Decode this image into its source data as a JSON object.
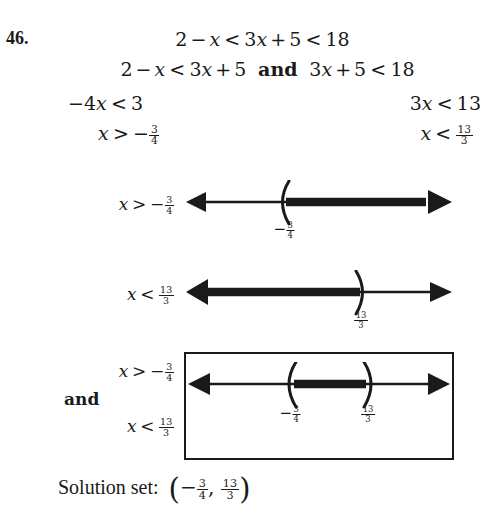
{
  "problem": {
    "number": "46.",
    "compound_inequality": "2 - x < 3x + 5 < 18"
  },
  "steps": {
    "split_left": "2 - x < 3x + 5",
    "split_connector": "and",
    "split_right": "3x + 5 < 18",
    "step2_left": "-4x < 3",
    "step2_right": "3x < 13",
    "step3_left": "x > -3/4",
    "step3_right": "x < 13/3"
  },
  "number_lines": [
    {
      "id": "line-1",
      "label": "x > -3/4",
      "label_parts": {
        "var": "x",
        "rel": ">",
        "sign": "-",
        "num": "3",
        "den": "4"
      },
      "tick_label": {
        "sign": "-",
        "num": "3",
        "den": "4"
      },
      "tick_position_pct": 38,
      "bracket": "(",
      "shaded_direction": "right",
      "left_arrow": true,
      "right_arrow": true
    },
    {
      "id": "line-2",
      "label": "x < 13/3",
      "label_parts": {
        "var": "x",
        "rel": "<",
        "sign": "",
        "num": "13",
        "den": "3"
      },
      "tick_label": {
        "sign": "",
        "num": "13",
        "den": "3"
      },
      "tick_position_pct": 66,
      "bracket": ")",
      "shaded_direction": "left",
      "left_arrow": true,
      "right_arrow": true
    }
  ],
  "intersection": {
    "label_lines": [
      {
        "type": "inequality",
        "var": "x",
        "rel": ">",
        "sign": "-",
        "num": "3",
        "den": "4"
      },
      {
        "type": "word",
        "text": "and"
      },
      {
        "type": "inequality",
        "var": "x",
        "rel": "<",
        "sign": "",
        "num": "13",
        "den": "3"
      }
    ],
    "left_bracket": "(",
    "right_bracket": ")",
    "left_tick": {
      "sign": "-",
      "num": "3",
      "den": "4"
    },
    "right_tick": {
      "sign": "",
      "num": "13",
      "den": "3"
    },
    "left_tick_pct": 39,
    "right_tick_pct": 67,
    "boxed": true
  },
  "solution": {
    "label": "Solution set:",
    "open_paren": "(",
    "left_sign": "-",
    "left_num": "3",
    "left_den": "4",
    "comma": ",",
    "right_num": "13",
    "right_den": "3",
    "close_paren": ")"
  },
  "colors": {
    "ink": "#1a1a1a",
    "background": "#ffffff",
    "box_border": "#1a1a1a"
  }
}
